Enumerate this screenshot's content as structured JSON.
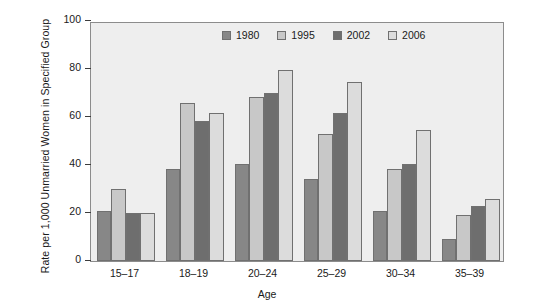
{
  "chart_data": {
    "type": "bar",
    "title": "",
    "subtitle": "",
    "xlabel": "Age",
    "ylabel": "Rate per 1,000 Unmarried Women in Specified Group",
    "categories": [
      "15–17",
      "18–19",
      "20–24",
      "25–29",
      "30–34",
      "35–39"
    ],
    "ylim": [
      0,
      100
    ],
    "yticks": [
      0,
      20,
      40,
      60,
      80,
      100
    ],
    "ytick_labels": [
      "0",
      "20",
      "40",
      "60",
      "80",
      "100"
    ],
    "grid": false,
    "legend_position": "top-center-inside",
    "series": [
      {
        "name": "1980",
        "color": "#878787",
        "values": [
          21,
          38.5,
          40.5,
          34,
          21,
          9
        ]
      },
      {
        "name": "1995",
        "color": "#c8c8c8",
        "values": [
          30,
          66,
          68.5,
          53,
          38.5,
          19
        ]
      },
      {
        "name": "2002",
        "color": "#6e6e6e",
        "values": [
          20,
          58.5,
          70,
          61.5,
          40.5,
          23
        ]
      },
      {
        "name": "2006",
        "color": "#dcdcdc",
        "values": [
          20,
          61.5,
          79.5,
          74.5,
          54.5,
          26
        ]
      }
    ]
  },
  "style": {
    "plot_background": "#eeeeee",
    "page_background": "#ffffff",
    "axis_color": "#8c8c8c",
    "text_color": "#1a1a1a",
    "bar_border": "#707070"
  }
}
